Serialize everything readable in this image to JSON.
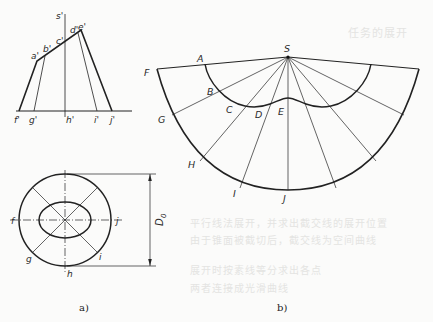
{
  "figure": {
    "part_a": {
      "caption": "a)",
      "elevation_labels": {
        "s": "s'",
        "a": "a'",
        "b": "b'",
        "c": "c'",
        "d": "d'",
        "e": "e'",
        "f": "f'",
        "g": "g'",
        "h": "h'",
        "i": "i'",
        "j": "j'"
      },
      "plan_labels": {
        "f": "f",
        "g": "g",
        "h": "h",
        "i": "i",
        "j": "j"
      },
      "dimension_label": "D",
      "dimension_subscript": "0"
    },
    "part_b": {
      "caption": "b)",
      "apex_label": "S",
      "outer_labels": [
        "F",
        "G",
        "H",
        "I",
        "J"
      ],
      "inner_labels": [
        "A",
        "B",
        "C",
        "D",
        "E"
      ]
    }
  },
  "background_text": {
    "heading": "任务的展开",
    "lines": [
      "平行线法展开，并求出截交线的展开位置",
      "由于锥面被截切后，截交线为空间曲线",
      "展开时按素线等分求出各点",
      "两者连接成光滑曲线"
    ]
  }
}
